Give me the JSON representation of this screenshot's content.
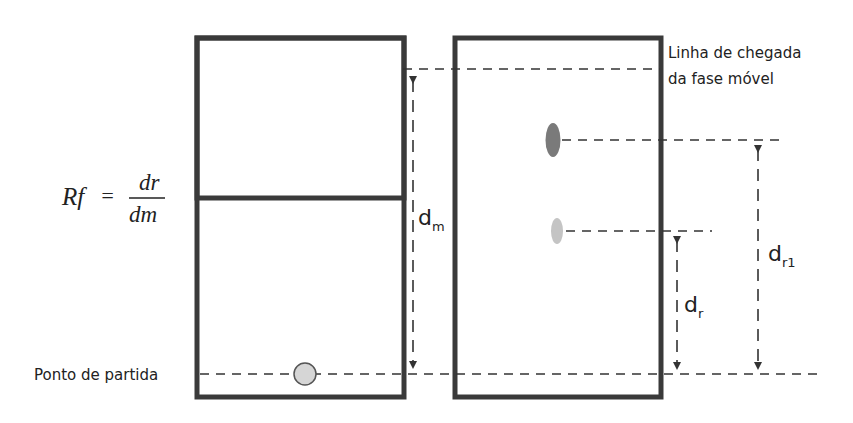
{
  "formula": {
    "lhs": "Rf",
    "equals": "=",
    "numerator": "dr",
    "denominator": "dm"
  },
  "labels": {
    "finish_line_1": "Linha de chegada",
    "finish_line_2": "da fase móvel",
    "start_point": "Ponto de partida",
    "dm_base": "d",
    "dm_sub": "m",
    "dr_base": "d",
    "dr_sub": "r",
    "dr1_base": "d",
    "dr1_sub": "r1"
  },
  "colors": {
    "plate_border": "#3a3a3a",
    "start_spot_fill": "#d6d6d6",
    "spot_dark": "#7a7a7a",
    "spot_light": "#c4c4c4"
  }
}
